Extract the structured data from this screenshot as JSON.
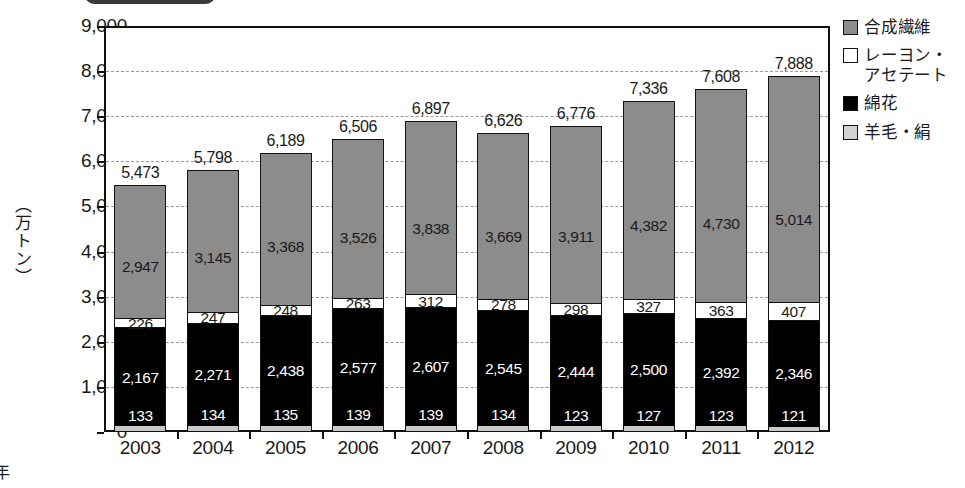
{
  "top_tab": {
    "name": "cropped-tab"
  },
  "axes": {
    "y_label": "（万トン）",
    "x_label": "年",
    "y_ticks": [
      "9,000",
      "8,000",
      "7,000",
      "6,000",
      "5,000",
      "4,000",
      "3,000",
      "2,000",
      "1,000",
      "0"
    ]
  },
  "legend": {
    "items": [
      {
        "label": "合成繊維",
        "swatch": "gray-swatch",
        "color": "#8c8c8c"
      },
      {
        "label": "レーヨン・\nアセテート",
        "line1": "レーヨン・",
        "line2": "アセテート",
        "swatch": "white-swatch",
        "color": "#ffffff"
      },
      {
        "label": "綿花",
        "swatch": "black-swatch",
        "color": "#000000"
      },
      {
        "label": "羊毛・絹",
        "swatch": "light-gray-swatch",
        "color": "#d2d2d2"
      }
    ]
  },
  "chart_data": {
    "type": "bar",
    "subtype": "stacked",
    "title": "",
    "xlabel": "年",
    "ylabel": "（万トン）",
    "ylim": [
      0,
      9000
    ],
    "ytick_step": 1000,
    "grid": true,
    "legend_position": "right",
    "categories": [
      "2003",
      "2004",
      "2005",
      "2006",
      "2007",
      "2008",
      "2009",
      "2010",
      "2011",
      "2012"
    ],
    "series": [
      {
        "name": "羊毛・絹",
        "color": "#d2d2d2",
        "values": [
          133,
          134,
          135,
          139,
          139,
          134,
          123,
          127,
          123,
          121
        ]
      },
      {
        "name": "綿花",
        "color": "#000000",
        "values": [
          2167,
          2271,
          2438,
          2577,
          2607,
          2545,
          2444,
          2500,
          2392,
          2346
        ]
      },
      {
        "name": "レーヨン・アセテート",
        "color": "#ffffff",
        "values": [
          226,
          247,
          248,
          263,
          312,
          278,
          298,
          327,
          363,
          407
        ]
      },
      {
        "name": "合成繊維",
        "color": "#8c8c8c",
        "values": [
          2947,
          3145,
          3368,
          3526,
          3838,
          3669,
          3911,
          4382,
          4730,
          5014
        ]
      }
    ],
    "totals": [
      5473,
      5798,
      6189,
      6506,
      6897,
      6626,
      6776,
      7336,
      7608,
      7888
    ],
    "total_labels": [
      "5,473",
      "5,798",
      "6,189",
      "6,506",
      "6,897",
      "6,626",
      "6,776",
      "7,336",
      "7,608",
      "7,888"
    ],
    "value_labels": {
      "羊毛・絹": [
        "133",
        "134",
        "135",
        "139",
        "139",
        "134",
        "123",
        "127",
        "123",
        "121"
      ],
      "綿花": [
        "2,167",
        "2,271",
        "2,438",
        "2,577",
        "2,607",
        "2,545",
        "2,444",
        "2,500",
        "2,392",
        "2,346"
      ],
      "レーヨン・アセテート": [
        "226",
        "247",
        "248",
        "263",
        "312",
        "278",
        "298",
        "327",
        "363",
        "407"
      ],
      "合成繊維": [
        "2,947",
        "3,145",
        "3,368",
        "3,526",
        "3,838",
        "3,669",
        "3,911",
        "4,382",
        "4,730",
        "5,014"
      ]
    }
  }
}
